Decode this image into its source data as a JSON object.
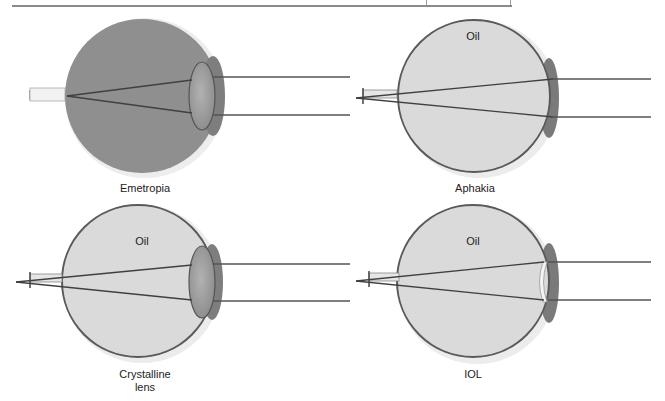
{
  "figure": {
    "panels": [
      {
        "id": "emetropia",
        "caption": "Emetropia",
        "fill_label": "",
        "lens": "crystalline",
        "fill_color": "#8f8f8f"
      },
      {
        "id": "aphakia",
        "caption": "Aphakia",
        "fill_label": "Oil",
        "lens": "none",
        "fill_color": "#d8d8d8"
      },
      {
        "id": "crystalline-lens",
        "caption_line1": "Crystalline",
        "caption_line2": "lens",
        "fill_label": "Oil",
        "lens": "crystalline",
        "fill_color": "#d8d8d8"
      },
      {
        "id": "iol",
        "caption": "IOL",
        "fill_label": "Oil",
        "lens": "iol",
        "fill_color": "#d8d8d8"
      }
    ],
    "colors": {
      "ray": "#4a4a4a",
      "sclera_rim": "#5a5a5a",
      "cornea": "#8a8a8a",
      "lens": "#a0a0a0",
      "outer_halo": "#e6e6e6",
      "rule": "#8a8a8a"
    }
  }
}
